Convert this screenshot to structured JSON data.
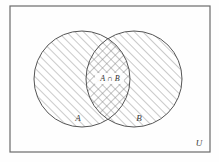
{
  "figure": {
    "type": "venn-diagram",
    "title": "",
    "background_color": "#fefefe",
    "stroke_color": "#555555",
    "hatch_color": "#8a8a8a"
  },
  "universe": {
    "label": "U",
    "rect": {
      "x": 10,
      "y": 6,
      "width": 200,
      "height": 146
    }
  },
  "sets": [
    {
      "id": "A",
      "label": "A",
      "fill_pattern": "diagonal-hatch",
      "center_x": 82,
      "center_y": 79,
      "radius": 48,
      "label_x": 78,
      "label_y": 121
    },
    {
      "id": "B",
      "label": "B",
      "fill_pattern": "diagonal-hatch",
      "center_x": 134,
      "center_y": 79,
      "radius": 48,
      "label_x": 139,
      "label_y": 121
    }
  ],
  "intersection": {
    "label": "A ∩ B",
    "fill_pattern": "cross-hatch",
    "label_x": 110,
    "label_y": 81
  }
}
